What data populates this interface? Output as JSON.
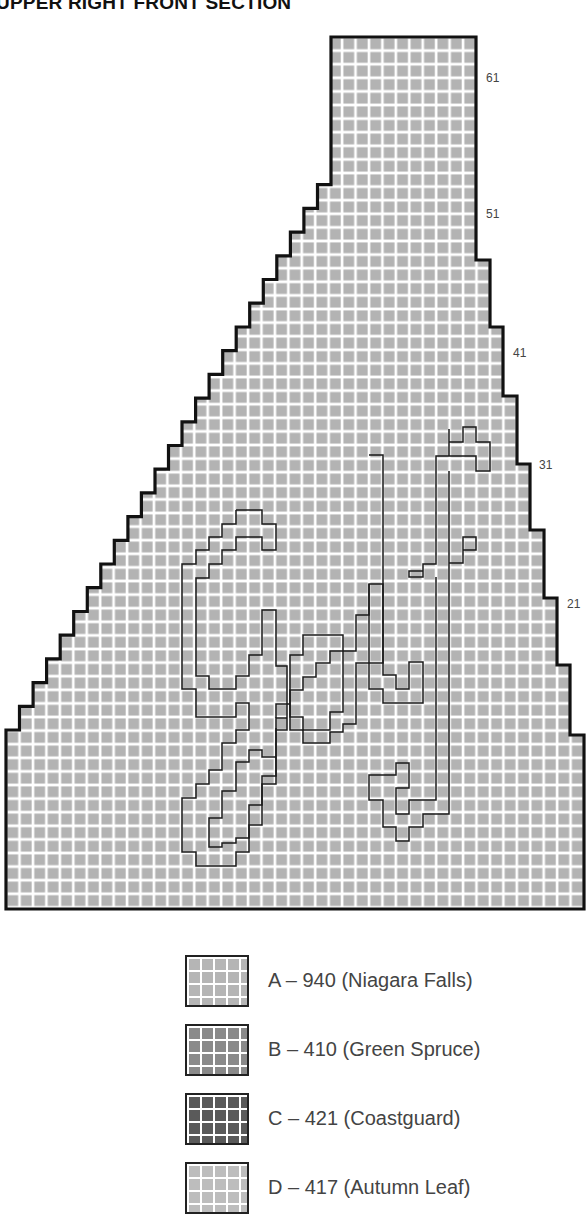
{
  "title": "UPPER RIGHT FRONT SECTION",
  "chart": {
    "type": "knitting-chart",
    "grid": {
      "cols": 43,
      "rows": 65,
      "cell_color": "#b3b3b3",
      "grid_line_color": "#ffffff",
      "outline_color": "#111111"
    },
    "row_labels": [
      {
        "text": "61",
        "x": 486,
        "y": 71
      },
      {
        "text": "51",
        "x": 486,
        "y": 207
      },
      {
        "text": "41",
        "x": 513,
        "y": 346
      },
      {
        "text": "31",
        "x": 539,
        "y": 458
      },
      {
        "text": "21",
        "x": 567,
        "y": 597
      }
    ],
    "motif_text": "Golf"
  },
  "legend": {
    "items": [
      {
        "key": "A",
        "label": "A – 940 (Niagara Falls)",
        "color": "#b5b5b5"
      },
      {
        "key": "B",
        "label": "B – 410 (Green Spruce)",
        "color": "#8a8a8a"
      },
      {
        "key": "C",
        "label": "C – 421 (Coastguard)",
        "color": "#5a5a5a"
      },
      {
        "key": "D",
        "label": "D – 417 (Autumn Leaf)",
        "color": "#bdbdbd"
      }
    ]
  }
}
